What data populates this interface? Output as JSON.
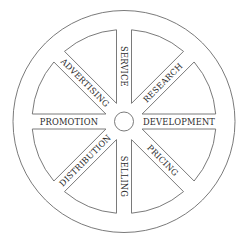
{
  "diagram": {
    "type": "wheel",
    "center": {
      "x": 124,
      "y": 121.5
    },
    "outer_radius": 111,
    "inner_radius": 92,
    "hub_radius": 9.5,
    "spoke_half_width": 7.5,
    "line_color": "#6b6b6b",
    "text_color": "#2a2a2a",
    "spokes": [
      {
        "label": "DEVELOPMENT",
        "angle": 0
      },
      {
        "label": "PRICING",
        "angle": 45
      },
      {
        "label": "SELLING",
        "angle": 90
      },
      {
        "label": "DISTRIBUTION",
        "angle": 135
      },
      {
        "label": "PROMOTION",
        "angle": 180
      },
      {
        "label": "ADVERTISING",
        "angle": 225
      },
      {
        "label": "SERVICE",
        "angle": 270
      },
      {
        "label": "RESEARCH",
        "angle": 315
      }
    ]
  }
}
